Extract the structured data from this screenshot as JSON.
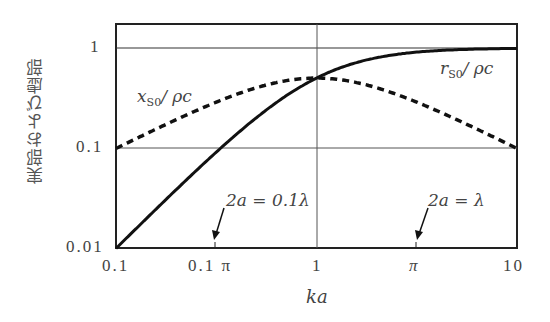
{
  "chart_data": {
    "type": "line",
    "title": "",
    "xlabel": "ka",
    "ylabel": "実部および虚部",
    "xscale": "log",
    "yscale": "log",
    "xlim": [
      0.1,
      10
    ],
    "ylim": [
      0.01,
      1
    ],
    "x_ticks": [
      "0.1",
      "0.1 π",
      "1",
      "π",
      "10"
    ],
    "y_ticks": [
      "0.01",
      "0.1",
      "1"
    ],
    "grid": {
      "horizontal": [
        0.1,
        1
      ],
      "vertical": [
        1
      ]
    },
    "series": [
      {
        "name": "r_S0/ρc",
        "style": "solid",
        "x": [
          0.1,
          0.2,
          0.3162,
          0.5,
          1,
          2,
          3.162,
          5,
          10
        ],
        "values": [
          0.0099,
          0.0385,
          0.0909,
          0.2,
          0.5,
          0.8,
          0.909,
          0.962,
          0.99
        ]
      },
      {
        "name": "x_S0/ρc",
        "style": "dashed",
        "x": [
          0.1,
          0.2,
          0.3162,
          0.5,
          1,
          2,
          3.162,
          5,
          10
        ],
        "values": [
          0.099,
          0.192,
          0.287,
          0.4,
          0.5,
          0.4,
          0.287,
          0.192,
          0.099
        ]
      }
    ],
    "annotations": [
      {
        "text": "2a = 0.1λ",
        "x": 0.3142,
        "arrow": true
      },
      {
        "text": "2a = λ",
        "x": 3.142,
        "arrow": true
      }
    ]
  },
  "labels": {
    "y_axis": "実部および虚部",
    "x_axis": "ka",
    "ytick_1": "1",
    "ytick_01": "0.1",
    "ytick_001": "0.01",
    "xtick_01": "0.1",
    "xtick_01pi": "0.1 π",
    "xtick_1": "1",
    "xtick_pi": "π",
    "xtick_10": "10",
    "series_r_main": "r",
    "series_r_sub": "S0",
    "series_r_rest": "/ ρc",
    "series_x_main": "x",
    "series_x_sub": "S0",
    "series_x_rest": "/ ρc",
    "annot_1": "2a = 0.1λ",
    "annot_2": "2a = λ"
  }
}
